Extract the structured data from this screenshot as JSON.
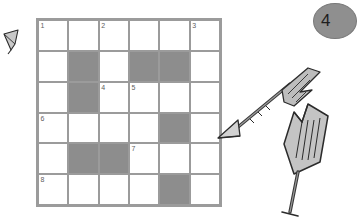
{
  "page": {
    "background_color": "#ffffff",
    "width": 341,
    "height": 220
  },
  "page_number_badge": {
    "name": "page-number-badge",
    "label": "4",
    "background_color": "#8f8f8f",
    "text_color": "#1e1e1e"
  },
  "crossword": {
    "title": "crossword-grid",
    "rows": 6,
    "columns": 6,
    "colors": {
      "grid_line": "#9b9b9b",
      "open_cell": "#ffffff",
      "block_cell": "#8d8d8d",
      "number_text": "#5e5e5e"
    },
    "cells": [
      [
        {
          "block": false,
          "number": "1"
        },
        {
          "block": false,
          "number": ""
        },
        {
          "block": false,
          "number": "2"
        },
        {
          "block": false,
          "number": ""
        },
        {
          "block": false,
          "number": ""
        },
        {
          "block": false,
          "number": "3"
        }
      ],
      [
        {
          "block": false,
          "number": ""
        },
        {
          "block": true,
          "number": ""
        },
        {
          "block": false,
          "number": ""
        },
        {
          "block": true,
          "number": ""
        },
        {
          "block": true,
          "number": ""
        },
        {
          "block": false,
          "number": ""
        }
      ],
      [
        {
          "block": false,
          "number": ""
        },
        {
          "block": true,
          "number": ""
        },
        {
          "block": false,
          "number": "4"
        },
        {
          "block": false,
          "number": "5"
        },
        {
          "block": false,
          "number": ""
        },
        {
          "block": false,
          "number": ""
        }
      ],
      [
        {
          "block": false,
          "number": "6"
        },
        {
          "block": false,
          "number": ""
        },
        {
          "block": false,
          "number": ""
        },
        {
          "block": false,
          "number": ""
        },
        {
          "block": true,
          "number": ""
        },
        {
          "block": false,
          "number": ""
        }
      ],
      [
        {
          "block": false,
          "number": ""
        },
        {
          "block": true,
          "number": ""
        },
        {
          "block": true,
          "number": ""
        },
        {
          "block": false,
          "number": "7"
        },
        {
          "block": false,
          "number": ""
        },
        {
          "block": false,
          "number": ""
        }
      ],
      [
        {
          "block": false,
          "number": "8"
        },
        {
          "block": false,
          "number": ""
        },
        {
          "block": false,
          "number": ""
        },
        {
          "block": false,
          "number": ""
        },
        {
          "block": true,
          "number": ""
        },
        {
          "block": false,
          "number": ""
        }
      ]
    ]
  },
  "decorations": [
    {
      "name": "left-arrowhead-icon",
      "description": "small arrowhead at left margin"
    },
    {
      "name": "horizontal-arrow-icon",
      "description": "arrow pointing left toward the grid"
    },
    {
      "name": "vertical-arrow-icon",
      "description": "upright fletched arrow"
    }
  ]
}
